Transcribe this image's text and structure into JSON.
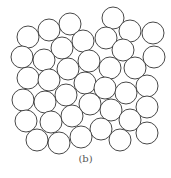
{
  "figure": {
    "caption": "(b)",
    "circle_radius": 11,
    "stroke_color": "#333333",
    "fill_color": "#ffffff",
    "circles": [
      [
        113,
        18
      ],
      [
        70,
        24
      ],
      [
        49,
        30
      ],
      [
        28,
        37
      ],
      [
        130,
        31
      ],
      [
        153,
        33
      ],
      [
        106,
        38
      ],
      [
        83,
        41
      ],
      [
        62,
        48
      ],
      [
        123,
        50
      ],
      [
        22,
        57
      ],
      [
        44,
        60
      ],
      [
        154,
        57
      ],
      [
        89,
        61
      ],
      [
        68,
        69
      ],
      [
        110,
        68
      ],
      [
        135,
        68
      ],
      [
        28,
        78
      ],
      [
        49,
        80
      ],
      [
        85,
        83
      ],
      [
        105,
        88
      ],
      [
        147,
        86
      ],
      [
        126,
        93
      ],
      [
        23,
        100
      ],
      [
        45,
        102
      ],
      [
        66,
        95
      ],
      [
        90,
        104
      ],
      [
        111,
        110
      ],
      [
        147,
        107
      ],
      [
        26,
        121
      ],
      [
        51,
        122
      ],
      [
        72,
        116
      ],
      [
        130,
        120
      ],
      [
        101,
        129
      ],
      [
        37,
        140
      ],
      [
        59,
        143
      ],
      [
        81,
        137
      ],
      [
        120,
        140
      ],
      [
        147,
        133
      ]
    ]
  }
}
